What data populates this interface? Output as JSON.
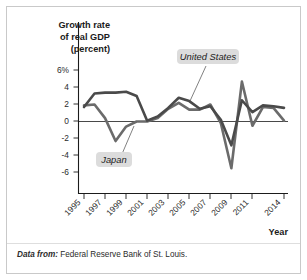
{
  "figure": {
    "source_prefix": "Data from:",
    "source_text": "Federal Reserve Bank of St. Louis.",
    "border_color": "#c9c9c9",
    "background": "#ffffff"
  },
  "chart_data": {
    "type": "line",
    "title": "",
    "ylabel": "Growth rate\nof real GDP\n(percent)",
    "ylabel_lines": [
      "Growth rate",
      "of real GDP",
      "(percent)"
    ],
    "xlabel": "Year",
    "ylim": [
      -7,
      7
    ],
    "xlim": [
      1995,
      2014
    ],
    "grid": false,
    "legend_position": "inline-annotations",
    "yticks": [
      6,
      4,
      2,
      0,
      -2,
      -4,
      -6
    ],
    "ytick_labels": [
      "6%",
      "4",
      "2",
      "0",
      "-2",
      "-4",
      "-6"
    ],
    "xticks": [
      1995,
      1997,
      1999,
      2001,
      2003,
      2005,
      2007,
      2009,
      2011,
      2014
    ],
    "xtick_labels": [
      "1995",
      "1997",
      "1999",
      "2001",
      "2003",
      "2005",
      "2007",
      "2009",
      "2011",
      "2014"
    ],
    "x": [
      1995,
      1996,
      1997,
      1998,
      1999,
      2000,
      2001,
      2002,
      2003,
      2004,
      2005,
      2006,
      2007,
      2008,
      2009,
      2010,
      2011,
      2012,
      2013,
      2014
    ],
    "series": [
      {
        "name": "United States",
        "color": "#4a4a4a",
        "width": 2.6,
        "values": [
          1.7,
          3.3,
          3.4,
          3.4,
          3.5,
          3.0,
          0.1,
          0.6,
          1.6,
          2.8,
          2.4,
          1.5,
          1.8,
          0.2,
          -2.8,
          2.5,
          1.1,
          1.9,
          1.8,
          1.6
        ]
      },
      {
        "name": "Japan",
        "color": "#6b6b6b",
        "width": 2.6,
        "values": [
          1.9,
          2.0,
          0.4,
          -2.3,
          -0.6,
          0.0,
          0.0,
          0.4,
          1.5,
          2.2,
          1.4,
          1.4,
          2.0,
          -0.2,
          -5.5,
          4.7,
          -0.5,
          1.7,
          1.6,
          0.1
        ]
      }
    ],
    "annotations": [
      {
        "label": "United States",
        "x_px": 204,
        "y_px": 57
      },
      {
        "label": "Japan",
        "x_px": 115,
        "y_px": 160
      }
    ]
  }
}
